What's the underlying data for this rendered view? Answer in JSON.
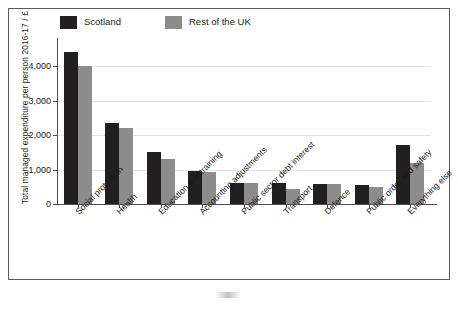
{
  "chart_data": {
    "type": "bar",
    "title": "",
    "xlabel": "",
    "ylabel": "Total managed expenditure per person 2016-17 / £",
    "ylim": [
      0,
      4700
    ],
    "yticks": [
      0,
      1000,
      2000,
      3000,
      4000
    ],
    "ytick_labels": [
      "0",
      "1,000",
      "2,000",
      "3,000",
      "4,000"
    ],
    "grid": true,
    "legend_position": "top-left",
    "categories": [
      "Social protection",
      "Health",
      "Education and training",
      "Accounting adjustments",
      "Public sector debt interest",
      "Transport",
      "Defence",
      "Public order and safety",
      "Everything else"
    ],
    "series": [
      {
        "name": "Scotland",
        "color": "#231f20",
        "values": [
          4400,
          2350,
          1520,
          960,
          620,
          600,
          580,
          560,
          1720
        ]
      },
      {
        "name": "Rest of the UK",
        "color": "#8c8c8c",
        "values": [
          4000,
          2200,
          1300,
          930,
          620,
          450,
          570,
          480,
          1190
        ]
      }
    ]
  },
  "legend": {
    "entries": [
      {
        "label": "Scotland",
        "color": "#231f20"
      },
      {
        "label": "Rest of the UK",
        "color": "#8c8c8c"
      }
    ]
  },
  "axes": {
    "y_title": "Total managed expenditure per person 2016-17 / £"
  }
}
